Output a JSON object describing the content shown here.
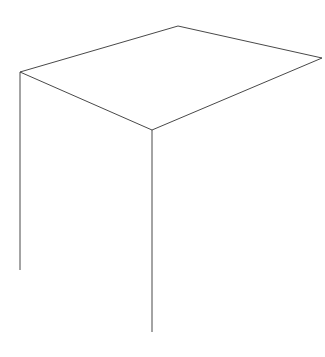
{
  "chart_data": {
    "type": "lego3d",
    "xlabel": "N_ch",
    "ylabel": "E_ch (GeV)",
    "zlabel": "",
    "x_axis": {
      "name": "N_ch",
      "ticks": [
        0,
        10,
        20,
        30
      ],
      "range": [
        0,
        35
      ]
    },
    "y_axis": {
      "name": "E_ch (GeV)",
      "ticks": [
        0,
        20,
        40,
        60,
        80,
        100
      ],
      "range": [
        0,
        100
      ]
    },
    "z_axis": {
      "ticks_labeled": false,
      "gridlines": 9
    },
    "grid": true,
    "annotations": [
      {
        "text": "μ+μ−",
        "points_to": "spike at N_ch≈2, E_ch≈91 GeV"
      },
      {
        "text": "e+e−",
        "points_to": "spike at N_ch≈2, E_ch≈91 GeV"
      },
      {
        "text": "γγ",
        "points_to": "ridge at low N_ch, low E_ch"
      },
      {
        "text": "τ+τ−",
        "points_to": "low multiplicity region N_ch≈2-6"
      },
      {
        "text": "qq̄",
        "points_to": "broad hadronic peak N_ch≈20, E_ch≈50 GeV"
      }
    ],
    "features": [
      {
        "name": "lepton pair spike (μμ, ee)",
        "N_ch": 2,
        "E_ch": 91,
        "relative_height": 1.0
      },
      {
        "name": "γγ low-energy ridge",
        "N_ch": [
          2,
          6
        ],
        "E_ch": [
          0,
          10
        ],
        "relative_height": 0.85
      },
      {
        "name": "τ+τ− shoulder",
        "N_ch": [
          2,
          8
        ],
        "E_ch": [
          20,
          80
        ],
        "relative_height": 0.35
      },
      {
        "name": "qq̄ hadronic hump",
        "N_ch": 20,
        "E_ch": 50,
        "relative_height": 0.22
      }
    ]
  },
  "labels": {
    "mumu": "μ",
    "mumu_sup1": "+",
    "mumu_mid": "μ",
    "mumu_sup2": "−",
    "ee": "e",
    "ee_sup1": "+",
    "ee_mid": "e",
    "ee_sup2": "−",
    "gg": "γγ",
    "tautau": "τ",
    "tautau_sup1": "+",
    "tautau_mid": "τ",
    "tautau_sup2": "−",
    "qq": "qq̄",
    "arrow_left": "←",
    "arrow_right": "→",
    "arrow_down": "↓",
    "y_axis_title_main": "E",
    "y_axis_title_sub": "ch",
    "y_axis_title_unit": " (GeV)",
    "x_axis_title_main": "N",
    "x_axis_title_sub": "ch"
  },
  "ticks": {
    "e": [
      "100",
      "80",
      "60",
      "40",
      "20",
      "0"
    ],
    "n": [
      "0",
      "10",
      "20",
      "30"
    ]
  }
}
